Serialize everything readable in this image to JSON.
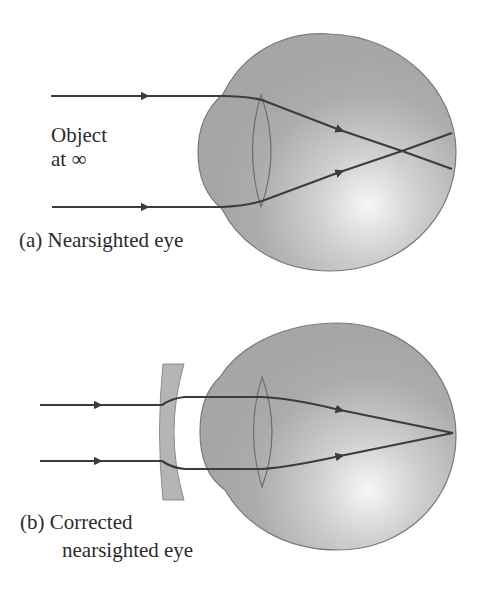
{
  "figure": {
    "panel_a": {
      "caption": "(a) Nearsighted eye",
      "object_label_line1": "Object",
      "object_label_line2": "at ∞",
      "description": "Parallel rays from an object at infinity focus in front of the retina"
    },
    "panel_b": {
      "caption_line1": "(b) Corrected",
      "caption_line2": "nearsighted eye",
      "description": "Diverging (concave) corrective lens makes rays focus on the retina"
    },
    "colors": {
      "eye_fill": "#a9a9a9",
      "eye_highlight": "#f4f4f4",
      "eye_outline": "#7a7a7a",
      "ray": "#3c3c3c",
      "corrective_lens_fill": "#b5b5b5",
      "background": "#ffffff"
    }
  }
}
